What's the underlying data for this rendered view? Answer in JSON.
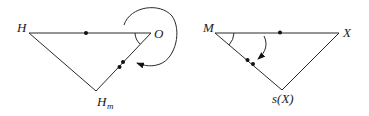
{
  "diagrams": [
    {
      "id": "left-triangle",
      "vertices": {
        "top_left": {
          "label": "H"
        },
        "top_right": {
          "label": "O"
        },
        "bottom": {
          "label": "H",
          "subscript": "m"
        }
      },
      "marks": {
        "top_edge_dots": 1,
        "right_edge_dots": 2,
        "angle_at": "O",
        "curved_arrow": "loops around O, pointing to edge O–H_m"
      }
    },
    {
      "id": "right-triangle",
      "vertices": {
        "top_left": {
          "label": "M"
        },
        "top_right": {
          "label": "X"
        },
        "bottom": {
          "label": "s(X)"
        }
      },
      "marks": {
        "top_edge_dots": 1,
        "left_edge_dots": 2,
        "angle_at": "M",
        "curved_arrow": "from top edge pointing to edge M–s(X)"
      }
    }
  ],
  "colors": {
    "line": "#2a2a2a",
    "text": "#1a1a1a",
    "background": "#ffffff"
  }
}
